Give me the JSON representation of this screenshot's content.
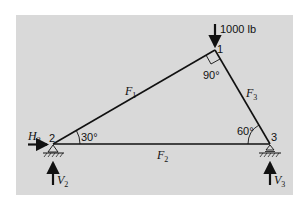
{
  "diagram": {
    "background_color": "#d9d9d9",
    "line_color": "#111111",
    "nodes": [
      {
        "id": "1",
        "label": "1"
      },
      {
        "id": "2",
        "label": "2"
      },
      {
        "id": "3",
        "label": "3"
      }
    ],
    "members": [
      {
        "label": "F",
        "subscript": "1"
      },
      {
        "label": "F",
        "subscript": "2"
      },
      {
        "label": "F",
        "subscript": "3"
      }
    ],
    "angles": [
      {
        "node": "1",
        "label": "90°"
      },
      {
        "node": "2",
        "label": "30°"
      },
      {
        "node": "3",
        "label": "60°"
      }
    ],
    "loads": {
      "applied": "1000 lb",
      "reactions": [
        {
          "label": "H",
          "subscript": "2"
        },
        {
          "label": "V",
          "subscript": "2"
        },
        {
          "label": "V",
          "subscript": "3"
        }
      ]
    }
  }
}
